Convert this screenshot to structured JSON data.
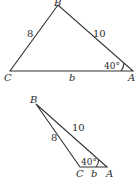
{
  "diagram": {
    "type": "two triangles (ambiguous case SSA)",
    "triangles": [
      {
        "name": "acute-case",
        "vertices": {
          "B": {
            "label": "B",
            "x": 58,
            "y": 5
          },
          "C": {
            "label": "C",
            "x": 10,
            "y": 71
          },
          "A": {
            "label": "A",
            "x": 133,
            "y": 71
          }
        },
        "sides": {
          "BC": {
            "label": "8"
          },
          "BA": {
            "label": "10"
          },
          "CA": {
            "label": "b"
          }
        },
        "angle_A": {
          "label": "40°"
        }
      },
      {
        "name": "obtuse-case",
        "vertices": {
          "B": {
            "label": "B",
            "x": 36,
            "y": 104
          },
          "C": {
            "label": "C",
            "x": 80,
            "y": 167
          },
          "A": {
            "label": "A",
            "x": 107,
            "y": 167
          }
        },
        "sides": {
          "BC": {
            "label": "8"
          },
          "BA": {
            "label": "10"
          },
          "CA": {
            "label": "b"
          }
        },
        "angle_A": {
          "label": "40°"
        }
      }
    ],
    "colors": {
      "stroke": "#333333",
      "text": "#2a2a2a",
      "background": "#ffffff"
    }
  }
}
